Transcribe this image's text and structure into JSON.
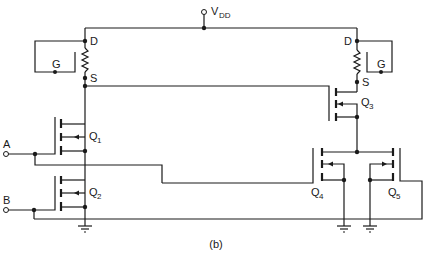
{
  "diagram": {
    "caption": "(b)",
    "supply": {
      "label": "V",
      "subscript": "DD"
    },
    "inputs": [
      {
        "id": "A",
        "label": "A"
      },
      {
        "id": "B",
        "label": "B"
      }
    ],
    "loads": [
      {
        "id": "left-load",
        "drain": "D",
        "gate": "G",
        "source": "S"
      },
      {
        "id": "right-load",
        "drain": "D",
        "gate": "G",
        "source": "S"
      }
    ],
    "transistors": [
      {
        "id": "Q1",
        "label": "Q",
        "subscript": "1"
      },
      {
        "id": "Q2",
        "label": "Q",
        "subscript": "2"
      },
      {
        "id": "Q3",
        "label": "Q",
        "subscript": "3"
      },
      {
        "id": "Q4",
        "label": "Q",
        "subscript": "4"
      },
      {
        "id": "Q5",
        "label": "Q",
        "subscript": "5"
      }
    ],
    "colors": {
      "line": "#1a1a1a",
      "background": "#ffffff"
    }
  }
}
